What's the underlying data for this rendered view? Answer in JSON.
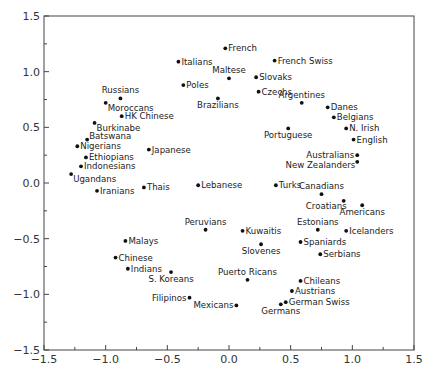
{
  "chart_data": {
    "type": "scatter",
    "title": "",
    "xlabel": "",
    "ylabel": "",
    "xlim": [
      -1.5,
      1.5
    ],
    "ylim": [
      -1.5,
      1.5
    ],
    "grid": false,
    "legend": null,
    "x_ticks": [
      "-1.5",
      "-1.0",
      "-0.5",
      "0.0",
      "0.5",
      "1.0",
      "1.5"
    ],
    "y_ticks": [
      "1.5",
      "1.0",
      "0.5",
      "0.0",
      "-0.5",
      "-1.0",
      "-1.5"
    ],
    "points": [
      {
        "label": "Russians",
        "x": -0.88,
        "y": 0.76,
        "pos": "above"
      },
      {
        "label": "Moroccans",
        "x": -1.0,
        "y": 0.72,
        "pos": "below-right"
      },
      {
        "label": "HK Chinese",
        "x": -0.87,
        "y": 0.6,
        "pos": "right"
      },
      {
        "label": "Burkinabe",
        "x": -1.09,
        "y": 0.54,
        "pos": "below-right"
      },
      {
        "label": "Batswana",
        "x": -1.15,
        "y": 0.39,
        "pos": "above-right"
      },
      {
        "label": "Nigerians",
        "x": -1.23,
        "y": 0.33,
        "pos": "right"
      },
      {
        "label": "Ethiopians",
        "x": -1.16,
        "y": 0.23,
        "pos": "right"
      },
      {
        "label": "Indonesians",
        "x": -1.2,
        "y": 0.15,
        "pos": "right"
      },
      {
        "label": "Ugandans",
        "x": -1.28,
        "y": 0.08,
        "pos": "below-right"
      },
      {
        "label": "Iranians",
        "x": -1.07,
        "y": -0.07,
        "pos": "right"
      },
      {
        "label": "Thais",
        "x": -0.69,
        "y": -0.04,
        "pos": "right"
      },
      {
        "label": "Japanese",
        "x": -0.65,
        "y": 0.3,
        "pos": "right"
      },
      {
        "label": "Italians",
        "x": -0.41,
        "y": 1.09,
        "pos": "right"
      },
      {
        "label": "Poles",
        "x": -0.37,
        "y": 0.88,
        "pos": "right"
      },
      {
        "label": "French",
        "x": -0.03,
        "y": 1.21,
        "pos": "right"
      },
      {
        "label": "Maltese",
        "x": 0.0,
        "y": 0.94,
        "pos": "above"
      },
      {
        "label": "Brazilians",
        "x": -0.09,
        "y": 0.76,
        "pos": "below"
      },
      {
        "label": "Slovaks",
        "x": 0.22,
        "y": 0.95,
        "pos": "right"
      },
      {
        "label": "Czechs",
        "x": 0.24,
        "y": 0.82,
        "pos": "right"
      },
      {
        "label": "French Swiss",
        "x": 0.37,
        "y": 1.1,
        "pos": "right"
      },
      {
        "label": "Argentines",
        "x": 0.59,
        "y": 0.72,
        "pos": "above"
      },
      {
        "label": "Danes",
        "x": 0.8,
        "y": 0.68,
        "pos": "right"
      },
      {
        "label": "Belgians",
        "x": 0.85,
        "y": 0.59,
        "pos": "right"
      },
      {
        "label": "N. Irish",
        "x": 0.95,
        "y": 0.49,
        "pos": "right"
      },
      {
        "label": "English",
        "x": 1.01,
        "y": 0.39,
        "pos": "right"
      },
      {
        "label": "Portuguese",
        "x": 0.48,
        "y": 0.49,
        "pos": "below"
      },
      {
        "label": "Australians",
        "x": 1.04,
        "y": 0.25,
        "pos": "left"
      },
      {
        "label": "New Zealanders",
        "x": 1.04,
        "y": 0.19,
        "pos": "left-below"
      },
      {
        "label": "Turks",
        "x": 0.38,
        "y": -0.02,
        "pos": "right"
      },
      {
        "label": "Lebanese",
        "x": -0.25,
        "y": -0.02,
        "pos": "right"
      },
      {
        "label": "Canadians",
        "x": 0.75,
        "y": -0.1,
        "pos": "above"
      },
      {
        "label": "Croatians",
        "x": 0.93,
        "y": -0.16,
        "pos": "below-left"
      },
      {
        "label": "Americans",
        "x": 1.08,
        "y": -0.2,
        "pos": "below"
      },
      {
        "label": "Peruvians",
        "x": -0.19,
        "y": -0.42,
        "pos": "above"
      },
      {
        "label": "Kuwaitis",
        "x": 0.11,
        "y": -0.43,
        "pos": "right"
      },
      {
        "label": "Estonians",
        "x": 0.72,
        "y": -0.42,
        "pos": "above"
      },
      {
        "label": "Icelanders",
        "x": 0.95,
        "y": -0.43,
        "pos": "right"
      },
      {
        "label": "Spaniards",
        "x": 0.58,
        "y": -0.53,
        "pos": "right"
      },
      {
        "label": "Slovenes",
        "x": 0.26,
        "y": -0.55,
        "pos": "below"
      },
      {
        "label": "Serbians",
        "x": 0.74,
        "y": -0.64,
        "pos": "right"
      },
      {
        "label": "Malays",
        "x": -0.84,
        "y": -0.52,
        "pos": "right"
      },
      {
        "label": "Chinese",
        "x": -0.92,
        "y": -0.67,
        "pos": "right"
      },
      {
        "label": "Indians",
        "x": -0.82,
        "y": -0.77,
        "pos": "right"
      },
      {
        "label": "S. Koreans",
        "x": -0.47,
        "y": -0.8,
        "pos": "below"
      },
      {
        "label": "Filipinos",
        "x": -0.32,
        "y": -1.03,
        "pos": "left"
      },
      {
        "label": "Mexicans",
        "x": 0.06,
        "y": -1.1,
        "pos": "left"
      },
      {
        "label": "Puerto Ricans",
        "x": 0.15,
        "y": -0.87,
        "pos": "above"
      },
      {
        "label": "Chileans",
        "x": 0.58,
        "y": -0.88,
        "pos": "right"
      },
      {
        "label": "Austrians",
        "x": 0.51,
        "y": -0.97,
        "pos": "right"
      },
      {
        "label": "German Swiss",
        "x": 0.46,
        "y": -1.07,
        "pos": "right"
      },
      {
        "label": "Germans",
        "x": 0.42,
        "y": -1.09,
        "pos": "below"
      }
    ]
  }
}
